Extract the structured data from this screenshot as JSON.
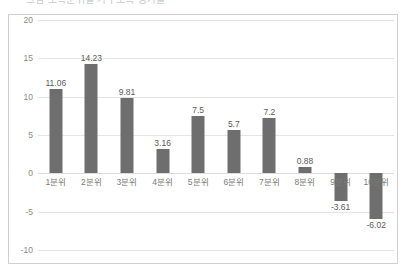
{
  "title_strip": {
    "text": "그림 소득분위별 가구소득 증가율"
  },
  "axis": {
    "y_ticks": [
      "20",
      "15",
      "10",
      "5",
      "0",
      "-5",
      "-10"
    ]
  },
  "colors": {
    "bar": "#6e6e6e",
    "gridline": "#e4e4e4",
    "border": "#d0d0d0",
    "tick_text": "#8a8a8a",
    "value_text": "#5a5a5a"
  },
  "chart_data": {
    "type": "bar",
    "title": "",
    "xlabel": "",
    "ylabel": "",
    "ylim": [
      -10,
      20
    ],
    "yticks": [
      20,
      15,
      10,
      5,
      0,
      -5,
      -10
    ],
    "grid": true,
    "legend": false,
    "categories": [
      "1분위",
      "2분위",
      "3분위",
      "4분위",
      "5분위",
      "6분위",
      "7분위",
      "8분위",
      "9분위",
      "10분위"
    ],
    "values": [
      11.06,
      14.23,
      9.81,
      3.16,
      7.5,
      5.7,
      7.2,
      0.88,
      -3.61,
      -6.02
    ],
    "value_labels": [
      "11.06",
      "14.23",
      "9.81",
      "3.16",
      "7.5",
      "5.7",
      "7.2",
      "0.88",
      "-3.61",
      "-6.02"
    ]
  }
}
